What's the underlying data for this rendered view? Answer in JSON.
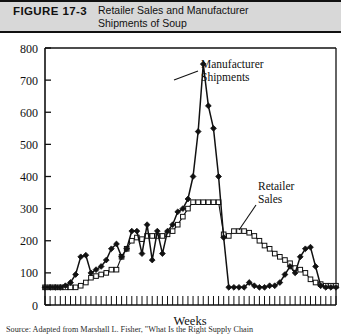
{
  "figure": {
    "number_label": "FIGURE 17-3",
    "title_line1": "Retailer Sales and Manufacturer",
    "title_line2": "Shipments of Soup",
    "source_note": "Source: Adapted from Marshall L. Fisher, \"What Is the Right Supply Chain"
  },
  "annotations": {
    "manufacturer_line1": "Manufacturer",
    "manufacturer_line2": "Shipments",
    "retailer_line1": "Retailer",
    "retailer_line2": "Sales"
  },
  "colors": {
    "ink": "#111111",
    "header_band": "#d8d8d8",
    "plot_background": "#ffffff",
    "manufacturer_marker": "#111111",
    "retailer_marker": "#ffffff",
    "retailer_marker_edge": "#111111"
  },
  "chart_data": {
    "type": "line",
    "title": "Retailer Sales and Manufacturer Shipments of Soup",
    "xlabel": "Weeks",
    "ylabel": "",
    "ylim": [
      0,
      800
    ],
    "ytick_values": [
      0,
      100,
      200,
      300,
      400,
      500,
      600,
      700,
      800
    ],
    "ytick_labels": [
      "0",
      "100",
      "200",
      "300",
      "400",
      "500",
      "600",
      "700",
      "800"
    ],
    "xlim": [
      1,
      58
    ],
    "xtick_labels": [],
    "grid": false,
    "legend": "inline-annotations",
    "x": [
      1,
      2,
      3,
      4,
      5,
      6,
      7,
      8,
      9,
      10,
      11,
      12,
      13,
      14,
      15,
      16,
      17,
      18,
      19,
      20,
      21,
      22,
      23,
      24,
      25,
      26,
      27,
      28,
      29,
      30,
      31,
      32,
      33,
      34,
      35,
      36,
      37,
      38,
      39,
      40,
      41,
      42,
      43,
      44,
      45,
      46,
      47,
      48,
      49,
      50,
      51,
      52,
      53,
      54,
      55,
      56,
      57,
      58
    ],
    "series": [
      {
        "name": "Manufacturer Shipments",
        "marker": "filled-diamond",
        "values": [
          55,
          55,
          55,
          55,
          60,
          70,
          95,
          150,
          155,
          100,
          110,
          120,
          140,
          175,
          190,
          150,
          175,
          230,
          230,
          160,
          250,
          140,
          230,
          160,
          230,
          250,
          290,
          300,
          330,
          400,
          540,
          750,
          620,
          550,
          400,
          210,
          55,
          55,
          55,
          55,
          70,
          60,
          55,
          55,
          60,
          60,
          70,
          95,
          120,
          100,
          150,
          175,
          180,
          120,
          60,
          55,
          55,
          55
        ]
      },
      {
        "name": "Retailer Sales",
        "marker": "open-square",
        "values": [
          55,
          55,
          55,
          55,
          55,
          55,
          55,
          60,
          70,
          85,
          90,
          95,
          100,
          110,
          110,
          150,
          175,
          200,
          210,
          205,
          215,
          215,
          215,
          215,
          220,
          230,
          250,
          275,
          300,
          320,
          320,
          320,
          320,
          320,
          320,
          220,
          215,
          230,
          230,
          230,
          225,
          215,
          200,
          185,
          175,
          160,
          150,
          140,
          130,
          115,
          110,
          100,
          80,
          70,
          65,
          60,
          60,
          60
        ]
      }
    ]
  }
}
